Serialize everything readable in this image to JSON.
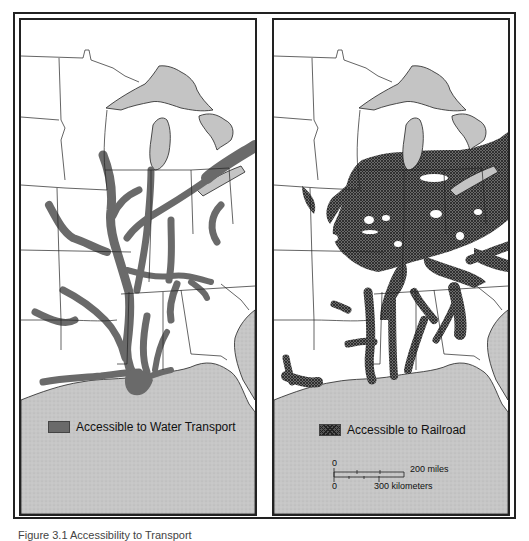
{
  "figure": {
    "caption_partial": "Figure 3.1  Accessibility to Transport"
  },
  "panels": [
    {
      "id": "water",
      "legend": {
        "label": "Accessible to Water Transport",
        "pattern": "solid-dark-gray",
        "color": "#6a6a6a"
      }
    },
    {
      "id": "railroad",
      "legend": {
        "label": "Accessible to Railroad",
        "pattern": "crosshatch",
        "color": "#4a4a4a"
      },
      "scale_bar": {
        "miles_zero": "0",
        "miles_label": "200 miles",
        "km_zero": "0",
        "km_label": "300 kilometers"
      }
    }
  ],
  "colors": {
    "water_body": "#c4c4c4",
    "land": "#ffffff",
    "border": "#222222",
    "access_water": "#6a6a6a",
    "access_rail": "#4a4a4a"
  }
}
